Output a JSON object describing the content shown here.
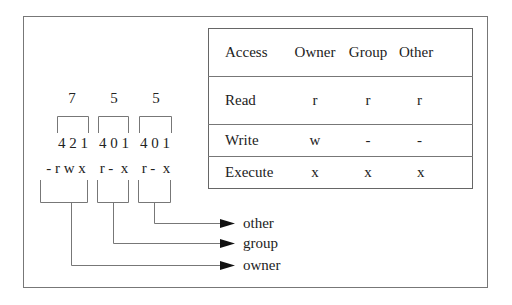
{
  "diagram": {
    "octal_digits": [
      "7",
      "5",
      "5"
    ],
    "bit_weights": [
      "4 2 1",
      "4 0 1",
      "4 0 1"
    ],
    "permission_string": [
      "- r w x",
      "r -  x",
      "r -  x"
    ],
    "targets": [
      "other",
      "group",
      "owner"
    ]
  },
  "table": {
    "headers": [
      "Access",
      "Owner",
      "Group",
      "Other"
    ],
    "rows": [
      {
        "label": "Read",
        "owner": "r",
        "group": "r",
        "other": "r"
      },
      {
        "label": "Write",
        "owner": "w",
        "group": "-",
        "other": "-"
      },
      {
        "label": "Execute",
        "owner": "x",
        "group": "x",
        "other": "x"
      }
    ]
  },
  "colors": {
    "line": "#777777",
    "text": "#222222",
    "arrow": "#111111"
  }
}
